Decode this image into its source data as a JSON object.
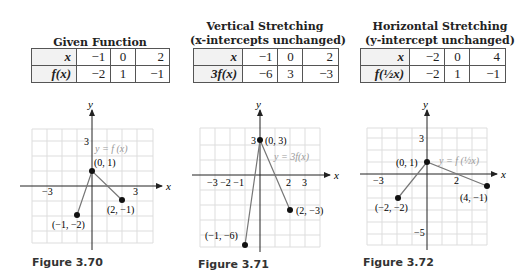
{
  "panels": [
    {
      "title_line1": "Given Function",
      "title_line2": "",
      "table": {
        "row1_label": "x",
        "row1_values": [
          "−1",
          "0",
          "2"
        ],
        "row2_label": "f(x)",
        "row2_values": [
          "−2",
          "1",
          "−1"
        ]
      },
      "graph": {
        "curve_label": "y = f(x)",
        "y_tick": "3",
        "x_ticks": [
          "−3",
          "3"
        ],
        "points": [
          {
            "label": "(−1, −2)",
            "x": -1,
            "y": -2
          },
          {
            "label": "(0, 1)",
            "x": 0,
            "y": 1
          },
          {
            "label": "(2, −1)",
            "x": 2,
            "y": -1
          }
        ]
      },
      "figure_caption": "Figure 3.70"
    },
    {
      "title_line1": "Vertical Stretching",
      "title_line2": "(x-intercepts unchanged)",
      "table": {
        "row1_label": "x",
        "row1_values": [
          "−1",
          "0",
          "2"
        ],
        "row2_label": "3f(x)",
        "row2_values": [
          "−6",
          "3",
          "−3"
        ]
      },
      "graph": {
        "curve_label": "y = 3f(x)",
        "y_tick": "3",
        "x_ticks": [
          "−3",
          "−2",
          "−1",
          "2",
          "3"
        ],
        "points": [
          {
            "label": "(−1, −6)",
            "x": -1,
            "y": -6
          },
          {
            "label": "(0, 3)",
            "x": 0,
            "y": 3
          },
          {
            "label": "(2, −3)",
            "x": 2,
            "y": -3
          }
        ]
      },
      "figure_caption": "Figure 3.71"
    },
    {
      "title_line1": "Horizontal Stretching",
      "title_line2": "(y-intercept unchanged)",
      "table": {
        "row1_label": "x",
        "row1_values": [
          "−2",
          "0",
          "4"
        ],
        "row2_label": "f(½x)",
        "row2_values": [
          "−2",
          "1",
          "−1"
        ]
      },
      "graph": {
        "curve_label": "y = f(½x)",
        "y_ticks": [
          "3",
          "−5"
        ],
        "x_ticks": [
          "−3",
          "2"
        ],
        "points": [
          {
            "label": "(−2, −2)",
            "x": -2,
            "y": -2
          },
          {
            "label": "(0, 1)",
            "x": 0,
            "y": 1
          },
          {
            "label": "(4, −1)",
            "x": 4,
            "y": -1
          }
        ]
      },
      "figure_caption": "Figure 3.72"
    }
  ],
  "axis_labels": {
    "x": "x",
    "y": "y"
  }
}
